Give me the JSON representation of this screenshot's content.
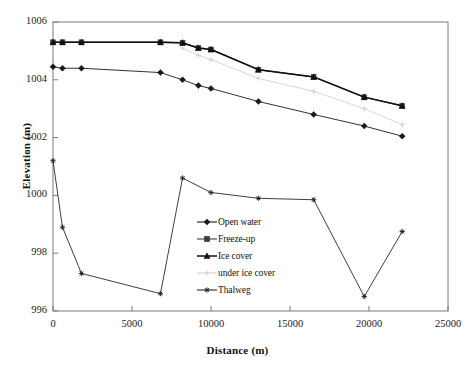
{
  "chart_data": {
    "type": "line",
    "title": "",
    "xlabel": "Distance (m)",
    "ylabel": "Elevation (m)",
    "xlim": [
      0,
      25000
    ],
    "ylim": [
      996,
      1006
    ],
    "xticks": [
      0,
      5000,
      10000,
      15000,
      20000,
      25000
    ],
    "yticks": [
      996,
      998,
      1000,
      1002,
      1004,
      1006
    ],
    "xtick_labels": [
      "0",
      "5000",
      "10000",
      "15000",
      "20000",
      "25000"
    ],
    "ytick_labels": [
      "996",
      "998",
      "1000",
      "1002",
      "1004",
      "1006"
    ],
    "grid": false,
    "legend_position": "center",
    "series": [
      {
        "name": "Open water",
        "color": "#1a1a1a",
        "marker": "diamond",
        "x": [
          0,
          600,
          1800,
          6800,
          8200,
          9200,
          10000,
          13000,
          16500,
          19700,
          22100
        ],
        "y": [
          1004.45,
          1004.4,
          1004.4,
          1004.25,
          1004.0,
          1003.8,
          1003.7,
          1003.25,
          1002.8,
          1002.4,
          1002.05
        ]
      },
      {
        "name": "Freeze-up",
        "color": "#3d3d3d",
        "marker": "square",
        "x": [
          0,
          600,
          1800,
          6800,
          8200,
          9200,
          10000,
          13000,
          16500,
          19700,
          22100
        ],
        "y": [
          1005.3,
          1005.3,
          1005.3,
          1005.3,
          1005.28,
          1005.1,
          1005.05,
          1004.35,
          1004.1,
          1003.4,
          1003.1
        ]
      },
      {
        "name": "Ice cover",
        "color": "#111111",
        "marker": "triangle",
        "x": [
          0,
          600,
          1800,
          6800,
          8200,
          9200,
          10000,
          13000,
          16500,
          19700,
          22100
        ],
        "y": [
          1005.3,
          1005.3,
          1005.3,
          1005.3,
          1005.28,
          1005.1,
          1005.05,
          1004.35,
          1004.1,
          1003.4,
          1003.1
        ]
      },
      {
        "name": "under ice cover",
        "color": "#d2d2d2",
        "marker": "cross",
        "x": [
          8200,
          9200,
          10000,
          13000,
          16500,
          19700,
          22100
        ],
        "y": [
          1005.1,
          1004.85,
          1004.7,
          1004.05,
          1003.6,
          1003.0,
          1002.45
        ]
      },
      {
        "name": "Thalweg",
        "color": "#2a2a2a",
        "marker": "star",
        "x": [
          0,
          600,
          1800,
          6800,
          8200,
          10000,
          13000,
          16500,
          19700,
          22100
        ],
        "y": [
          1001.2,
          998.9,
          997.3,
          996.6,
          1000.6,
          1000.1,
          999.9,
          999.85,
          996.5,
          998.75
        ]
      }
    ]
  },
  "legend": {
    "items": [
      {
        "label": "Open water"
      },
      {
        "label": "Freeze-up"
      },
      {
        "label": "Ice cover"
      },
      {
        "label": "under ice cover"
      },
      {
        "label": "Thalweg"
      }
    ]
  },
  "plot_frame": {
    "left": 53,
    "right": 448,
    "top": 22,
    "bottom": 311,
    "border_color": "#7a7a7a"
  }
}
